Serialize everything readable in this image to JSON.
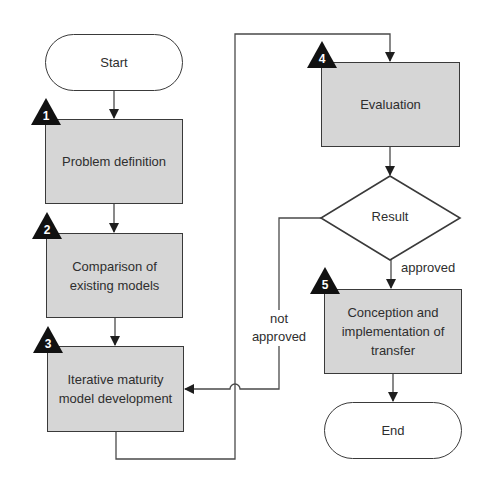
{
  "diagram": {
    "type": "flowchart",
    "nodes": {
      "start": {
        "label": "Start",
        "shape": "terminal"
      },
      "step1": {
        "number": "1",
        "label": "Problem definition",
        "shape": "process"
      },
      "step2": {
        "number": "2",
        "label_line1": "Comparison of",
        "label_line2": "existing models",
        "shape": "process"
      },
      "step3": {
        "number": "3",
        "label_line1": "Iterative maturity",
        "label_line2": "model development",
        "shape": "process"
      },
      "step4": {
        "number": "4",
        "label": "Evaluation",
        "shape": "process"
      },
      "decision": {
        "label": "Result",
        "shape": "decision"
      },
      "step5": {
        "number": "5",
        "label_line1": "Conception and",
        "label_line2": "implementation of",
        "label_line3": "transfer",
        "shape": "process"
      },
      "end": {
        "label": "End",
        "shape": "terminal"
      }
    },
    "edges": {
      "approved": "approved",
      "not_approved_line1": "not",
      "not_approved_line2": "approved"
    },
    "colors": {
      "stroke": "#3a3a3a",
      "process_fill": "#d6d6d6",
      "badge_fill": "#111111",
      "text": "#2e2e2e"
    }
  }
}
